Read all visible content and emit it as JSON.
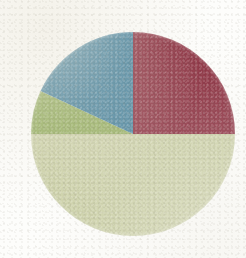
{
  "figure": {
    "kind": "pie-chart-image",
    "background_color": "#fdfdfb",
    "title": "",
    "caption": "",
    "center_x": 133,
    "center_y": 134,
    "radius": 102,
    "alt": "Pie chart with four slices: dark red, pale sage green, olive green, and steel blue"
  },
  "chart_data": {
    "type": "pie",
    "title": "",
    "xlabel": "",
    "ylabel": "",
    "grid": false,
    "legend": "none",
    "start_angle_deg": 90,
    "direction": "clockwise",
    "labels": [
      "Slice 1",
      "Slice 2",
      "Slice 3",
      "Slice 4"
    ],
    "values": [
      25,
      50,
      7,
      18
    ],
    "percentages": [
      "25%",
      "50%",
      "7%",
      "18%"
    ],
    "colors": [
      "#8c2f40",
      "#ccd1a8",
      "#93ad5e",
      "#417f9c"
    ],
    "slices": [
      {
        "label": "Slice 1",
        "value": 25,
        "percent": "25%",
        "color": "#8c2f40",
        "color_name": "dark-red",
        "start_angle_deg": 0,
        "end_angle_deg": 90
      },
      {
        "label": "Slice 2",
        "value": 50,
        "percent": "50%",
        "color": "#ccd1a8",
        "color_name": "pale-sage-green",
        "start_angle_deg": 90,
        "end_angle_deg": 270
      },
      {
        "label": "Slice 3",
        "value": 7,
        "percent": "7%",
        "color": "#93ad5e",
        "color_name": "olive-green",
        "start_angle_deg": 270,
        "end_angle_deg": 295
      },
      {
        "label": "Slice 4",
        "value": 18,
        "percent": "18%",
        "color": "#417f9c",
        "color_name": "steel-blue",
        "start_angle_deg": 295,
        "end_angle_deg": 360
      }
    ]
  }
}
